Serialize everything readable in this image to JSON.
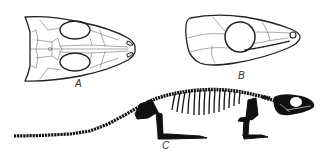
{
  "figure": {
    "panels": [
      {
        "id": "A",
        "label": "A",
        "description": "Skull, dorsal view"
      },
      {
        "id": "B",
        "label": "B",
        "description": "Skull, lateral view"
      },
      {
        "id": "C",
        "label": "C",
        "description": "Full skeleton reconstruction, lateral view"
      }
    ],
    "colors": {
      "line": "#222222",
      "fill_bone": "#111111",
      "background": "#ffffff",
      "label": "#333333"
    }
  }
}
